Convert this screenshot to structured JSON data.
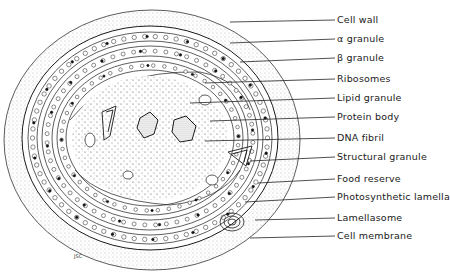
{
  "figure": {
    "type": "labeled cross-section illustration",
    "signature": "JSC"
  },
  "labels": [
    {
      "text": "Cell wall",
      "y": 19,
      "target": [
        230,
        22
      ]
    },
    {
      "text": "α granule",
      "y": 38,
      "target": [
        230,
        43
      ]
    },
    {
      "text": "β granule",
      "y": 57,
      "target": [
        240,
        62
      ]
    },
    {
      "text": "Ribosomes",
      "y": 78,
      "target": [
        205,
        83
      ]
    },
    {
      "text": "Lipid granule",
      "y": 97,
      "target": [
        190,
        103
      ]
    },
    {
      "text": "Protein body",
      "y": 116,
      "target": [
        210,
        121
      ]
    },
    {
      "text": "DNA fibril",
      "y": 137,
      "target": [
        205,
        141
      ]
    },
    {
      "text": "Structural granule",
      "y": 156,
      "target": [
        250,
        161
      ]
    },
    {
      "text": "Food reserve",
      "y": 178,
      "target": [
        258,
        183
      ]
    },
    {
      "text": "Photosynthetic lamella",
      "y": 196,
      "target": [
        245,
        202
      ]
    },
    {
      "text": "Lamellasome",
      "y": 217,
      "target": [
        255,
        220
      ]
    },
    {
      "text": "Cell membrane",
      "y": 235,
      "target": [
        250,
        238
      ]
    }
  ],
  "colors": {
    "ink": "#1a1a1a",
    "stipple": "#6b6b6b",
    "background": "#ffffff"
  }
}
